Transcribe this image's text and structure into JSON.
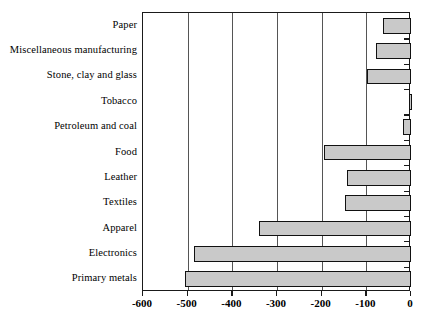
{
  "chart_data": {
    "type": "bar",
    "orientation": "horizontal",
    "title": "",
    "subtitle": "",
    "xlabel": "",
    "ylabel": "",
    "xlim": [
      -600,
      0
    ],
    "grid": true,
    "legend": false,
    "legend_position": "none",
    "xticks": [
      -600,
      -500,
      -400,
      -300,
      -200,
      -100,
      0
    ],
    "xtick_labels": [
      "-600",
      "-500",
      "-400",
      "-300",
      "-200",
      "-100",
      "0"
    ],
    "categories": [
      "Paper",
      "Miscellaneous manufacturing",
      "Stone, clay and glass",
      "Tobacco",
      "Petroleum and coal",
      "Food",
      "Leather",
      "Textiles",
      "Apparel",
      "Electronics",
      "Primary metals"
    ],
    "values": [
      -63,
      -78,
      -98,
      -5,
      -18,
      -195,
      -143,
      -148,
      -340,
      -485,
      -505
    ],
    "bar_fill_color": "#c9c9c9",
    "bar_edge_color": "#111111",
    "axis_color": "#1a1a1a",
    "grid_color": "#555555",
    "background_color": "#ffffff"
  },
  "axis": {
    "x_tick_labels": [
      "-600",
      "-500",
      "-400",
      "-300",
      "-200",
      "-100",
      "0"
    ]
  },
  "categories": {
    "c0": "Paper",
    "c1": "Miscellaneous manufacturing",
    "c2": "Stone, clay and glass",
    "c3": "Tobacco",
    "c4": "Petroleum and coal",
    "c5": "Food",
    "c6": "Leather",
    "c7": "Textiles",
    "c8": "Apparel",
    "c9": "Electronics",
    "c10": "Primary metals"
  }
}
